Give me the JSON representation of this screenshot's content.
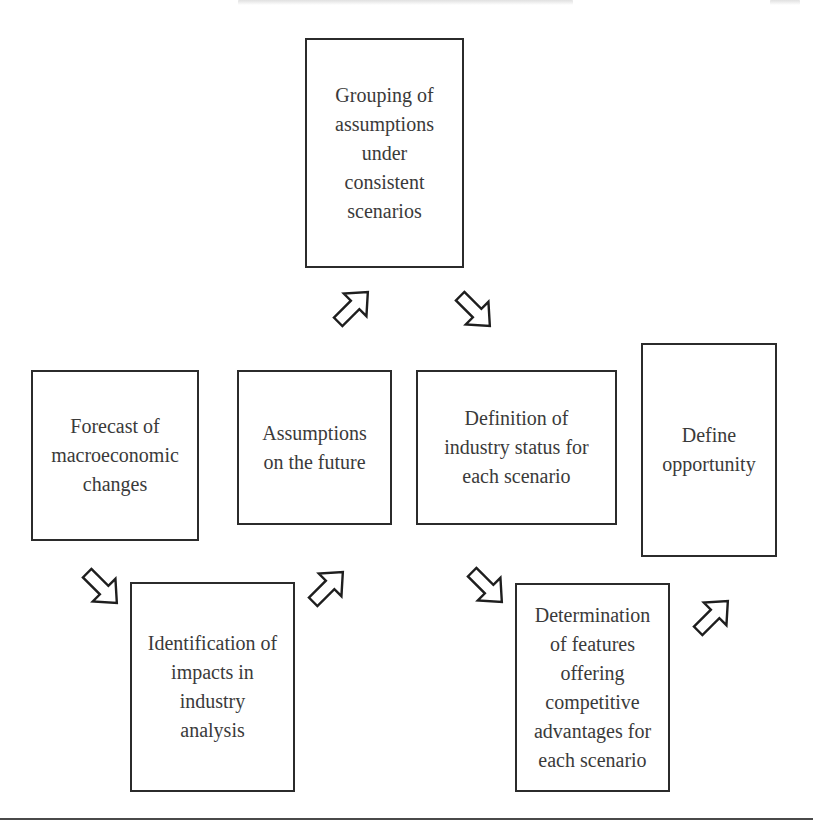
{
  "diagram": {
    "type": "process-flow",
    "header": {
      "note": "running head cropped at top edge, text not legible"
    },
    "boxes": [
      {
        "id": "grouping",
        "label": "Grouping of\nassumptions\nunder\nconsistent\nscenarios"
      },
      {
        "id": "forecast",
        "label": "Forecast of\nmacroeconomic\nchanges"
      },
      {
        "id": "assumptions",
        "label": "Assumptions\non the future"
      },
      {
        "id": "definition",
        "label": "Definition of\nindustry status for\neach scenario"
      },
      {
        "id": "define-opportunity",
        "label": "Define\nopportunity"
      },
      {
        "id": "identification",
        "label": "Identification of\nimpacts in\nindustry\nanalysis"
      },
      {
        "id": "determination",
        "label": "Determination\nof features\noffering\ncompetitive\nadvantages for\neach scenario"
      }
    ],
    "arrows": [
      {
        "id": "forecast-to-identification",
        "direction": "down-right"
      },
      {
        "id": "identification-to-assumptions",
        "direction": "up-right"
      },
      {
        "id": "assumptions-to-grouping",
        "direction": "up-right"
      },
      {
        "id": "grouping-to-definition",
        "direction": "down-right"
      },
      {
        "id": "definition-to-determination",
        "direction": "down-right"
      },
      {
        "id": "determination-to-define-opportunity",
        "direction": "up-right"
      }
    ],
    "flow_order": [
      "Forecast of macroeconomic changes",
      "Identification of impacts in industry analysis",
      "Assumptions on the future",
      "Grouping of assumptions under consistent scenarios",
      "Definition of industry status for each scenario",
      "Determination of features offering competitive advantages for each scenario",
      "Define opportunity"
    ],
    "colors": {
      "border": "#2b2b2b",
      "text": "#3a3a3a",
      "background": "#ffffff"
    }
  }
}
